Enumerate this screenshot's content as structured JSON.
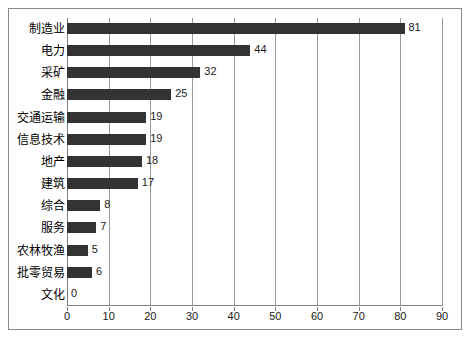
{
  "chart_data": {
    "type": "bar",
    "orientation": "horizontal",
    "title": "",
    "xlabel": "",
    "ylabel": "",
    "xlim": [
      0,
      90
    ],
    "xticks": [
      0,
      10,
      20,
      30,
      40,
      50,
      60,
      70,
      80,
      90
    ],
    "grid": true,
    "legend": null,
    "bar_color": "#333333",
    "categories": [
      "制造业",
      "电力",
      "采矿",
      "金融",
      "交通运输",
      "信息技术",
      "地产",
      "建筑",
      "综合",
      "服务",
      "农林牧渔",
      "批零贸易",
      "文化"
    ],
    "values": [
      81,
      44,
      32,
      25,
      19,
      19,
      18,
      17,
      8,
      7,
      5,
      6,
      0
    ],
    "value_labels": [
      "81",
      "44",
      "32",
      "25",
      "19",
      "19",
      "18",
      "17",
      "8",
      "7",
      "5",
      "6",
      "0"
    ]
  }
}
